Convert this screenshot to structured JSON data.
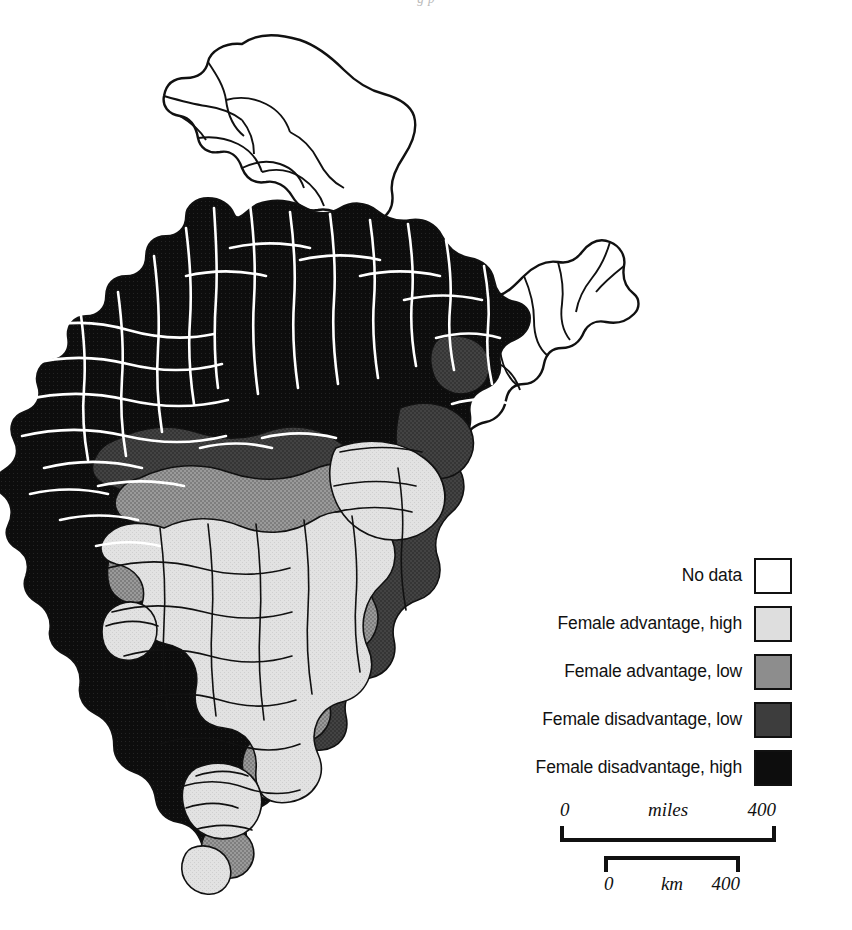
{
  "page": {
    "running_head_partial": "g p",
    "background_color": "#ffffff"
  },
  "map": {
    "title": "India district map of female advantage / disadvantage",
    "region_name": "India",
    "boundary_color": "#111111",
    "district_line_color_on_dark": "#ffffff",
    "classes": [
      {
        "key": "no-data",
        "label": "No data",
        "color": "#ffffff"
      },
      {
        "key": "female-advantage-high",
        "label": "Female advantage, high",
        "color": "#dedede"
      },
      {
        "key": "female-advantage-low",
        "label": "Female advantage, low",
        "color": "#8d8d8d"
      },
      {
        "key": "female-disadvantage-low",
        "label": "Female disadvantage, low",
        "color": "#3d3d3d"
      },
      {
        "key": "female-disadvantage-high",
        "label": "Female disadvantage, high",
        "color": "#0d0d0d"
      }
    ],
    "regional_pattern_notes": {
      "kashmir_north": "no-data",
      "northeast_states": "no-data",
      "northern_plains": "female-disadvantage-high",
      "gujarat_rajasthan_west": "female-disadvantage-high",
      "central_belt": "female-disadvantage-low",
      "deccan_plateau": "female-advantage-low",
      "southern_peninsula": "female-advantage-high",
      "eastern_coast": "female-advantage-high"
    }
  },
  "legend": {
    "name": "map-legend",
    "items": [
      {
        "label": "No data",
        "color": "#ffffff"
      },
      {
        "label": "Female advantage, high",
        "color": "#dedede"
      },
      {
        "label": "Female advantage, low",
        "color": "#8d8d8d"
      },
      {
        "label": "Female disadvantage, low",
        "color": "#3d3d3d"
      },
      {
        "label": "Female disadvantage, high",
        "color": "#0d0d0d"
      }
    ]
  },
  "scale_bars": [
    {
      "unit": "miles",
      "min": "0",
      "max": "400"
    },
    {
      "unit": "km",
      "min": "0",
      "max": "400"
    }
  ]
}
